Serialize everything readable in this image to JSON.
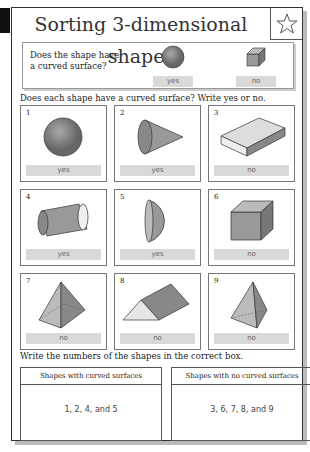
{
  "title": "Sorting 3-dimensional shapes",
  "star_icon": "star-outline-icon",
  "intro": {
    "question": "Does the shape have a curved surface?",
    "examples": [
      {
        "shape": "sphere",
        "answer": "yes"
      },
      {
        "shape": "cube",
        "answer": "no"
      }
    ]
  },
  "instruction1": "Does each shape have a curved surface? Write yes or no.",
  "shapes": [
    {
      "number": "1",
      "shape": "sphere",
      "answer": "yes"
    },
    {
      "number": "2",
      "shape": "cone",
      "answer": "yes"
    },
    {
      "number": "3",
      "shape": "rectangular prism",
      "answer": "no"
    },
    {
      "number": "4",
      "shape": "cylinder",
      "answer": "yes"
    },
    {
      "number": "5",
      "shape": "hemisphere",
      "answer": "yes"
    },
    {
      "number": "6",
      "shape": "cube",
      "answer": "no"
    },
    {
      "number": "7",
      "shape": "square pyramid",
      "answer": "no"
    },
    {
      "number": "8",
      "shape": "triangular prism",
      "answer": "no"
    },
    {
      "number": "9",
      "shape": "triangular pyramid",
      "answer": "no"
    }
  ],
  "instruction2": "Write the numbers of the shapes in the correct box.",
  "answer_boxes": [
    {
      "header": "Shapes with curved surfaces",
      "value": "1, 2, 4, and 5"
    },
    {
      "header": "Shapes with no curved surfaces",
      "value": "3, 6, 7, 8, and 9"
    }
  ]
}
